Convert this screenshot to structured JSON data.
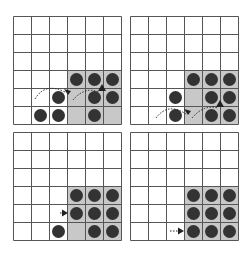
{
  "figure": {
    "grid_size": 6,
    "cell_px": 18,
    "colors": {
      "grid_line": "#555555",
      "shaded_block": "#c8c8c8",
      "dot": "#333333",
      "arrow": "#222222"
    },
    "shaded_block": {
      "col_start": 3,
      "row_start": 3,
      "cols": 3,
      "rows": 3
    },
    "panels": [
      {
        "id": "top-left",
        "left": 13,
        "top": 16,
        "dots": [
          [
            3,
            3
          ],
          [
            3,
            4
          ],
          [
            3,
            5
          ],
          [
            4,
            2
          ],
          [
            4,
            4
          ],
          [
            4,
            5
          ],
          [
            5,
            1
          ],
          [
            5,
            2
          ],
          [
            5,
            4
          ]
        ],
        "arrows": [
          {
            "path": "M 22 83 Q 32 66 52 76",
            "head": [
              55,
              79
            ],
            "dir": "down-right"
          },
          {
            "path": "M 60 84 Q 72 70 86 76",
            "head": [
              89,
              72
            ],
            "dir": "up"
          }
        ]
      },
      {
        "id": "top-right",
        "left": 130,
        "top": 16,
        "dots": [
          [
            3,
            3
          ],
          [
            3,
            4
          ],
          [
            3,
            5
          ],
          [
            4,
            2
          ],
          [
            4,
            4
          ],
          [
            4,
            5
          ],
          [
            5,
            2
          ],
          [
            5,
            4
          ],
          [
            5,
            5
          ]
        ],
        "arrows": [
          {
            "path": "M 26 102 Q 38 86 56 98",
            "head": [
              58,
              99
            ],
            "dir": "down-right"
          },
          {
            "path": "M 62 102 Q 74 88 88 92",
            "head": [
              90,
              88
            ],
            "dir": "up"
          }
        ]
      },
      {
        "id": "bottom-left",
        "left": 13,
        "top": 132,
        "dots": [
          [
            3,
            3
          ],
          [
            3,
            4
          ],
          [
            3,
            5
          ],
          [
            4,
            3
          ],
          [
            4,
            4
          ],
          [
            4,
            5
          ],
          [
            5,
            2
          ],
          [
            5,
            4
          ],
          [
            5,
            5
          ]
        ],
        "arrows": [
          {
            "path": "M 47 81 L 52 81",
            "head": [
              55,
              81
            ],
            "dir": "right"
          }
        ]
      },
      {
        "id": "bottom-right",
        "left": 130,
        "top": 132,
        "dots": [
          [
            3,
            3
          ],
          [
            3,
            4
          ],
          [
            3,
            5
          ],
          [
            4,
            3
          ],
          [
            4,
            4
          ],
          [
            4,
            5
          ],
          [
            5,
            3
          ],
          [
            5,
            4
          ],
          [
            5,
            5
          ]
        ],
        "arrows": [
          {
            "path": "M 40 99 L 50 99",
            "head": [
              54,
              99
            ],
            "dir": "right"
          }
        ]
      }
    ]
  }
}
